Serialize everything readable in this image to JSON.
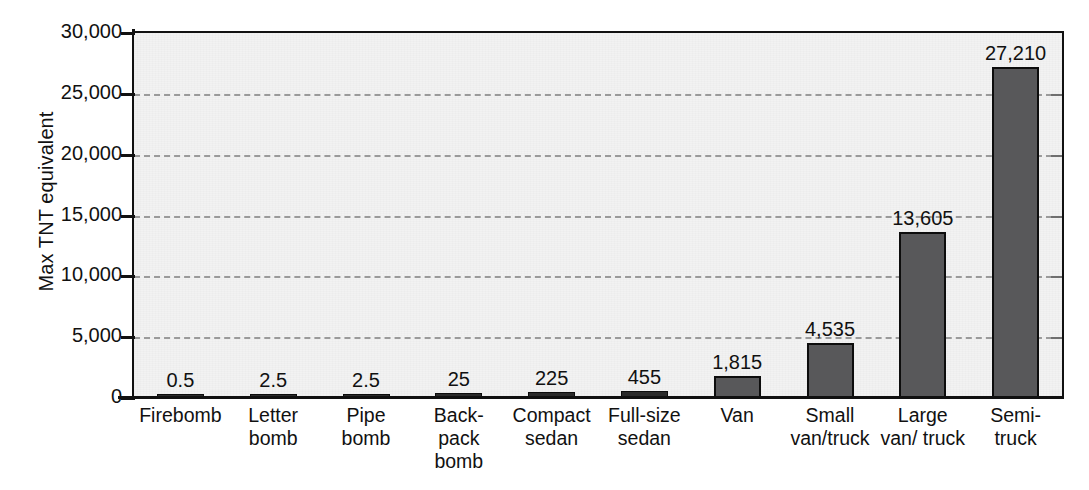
{
  "chart_data": {
    "type": "bar",
    "title": "",
    "subtitle": "",
    "xlabel": "",
    "ylabel": "Max TNT equivalent",
    "ylim": [
      0,
      30000
    ],
    "grid": true,
    "legend": null,
    "categories": [
      "Firebomb",
      "Letter bomb",
      "Pipe bomb",
      "Back-pack bomb",
      "Compact sedan",
      "Full-size sedan",
      "Van",
      "Small van/truck",
      "Large van/ truck",
      "Semi-truck"
    ],
    "category_lines": [
      [
        "Firebomb"
      ],
      [
        "Letter",
        "bomb"
      ],
      [
        "Pipe",
        "bomb"
      ],
      [
        "Back-",
        "pack",
        "bomb"
      ],
      [
        "Compact",
        "sedan"
      ],
      [
        "Full-size",
        "sedan"
      ],
      [
        "Van"
      ],
      [
        "Small",
        "van/truck"
      ],
      [
        "Large",
        "van/ truck"
      ],
      [
        "Semi-",
        "truck"
      ]
    ],
    "values": [
      0.5,
      2.5,
      2.5,
      25,
      225,
      455,
      1815,
      4535,
      13605,
      27210
    ],
    "value_labels": [
      "0.5",
      "2.5",
      "2.5",
      "25",
      "225",
      "455",
      "1,815",
      "4,535",
      "13,605",
      "27,210"
    ],
    "y_ticks": [
      0,
      5000,
      10000,
      15000,
      20000,
      25000,
      30000
    ],
    "y_tick_labels": [
      "0",
      "5,000",
      "10,000",
      "15,000",
      "20,000",
      "25,000",
      "30,000"
    ],
    "colors": {
      "bar_fill": "#58585a",
      "bar_border": "#0d0d0d",
      "plot_background": "#f2f2f2",
      "gridline": "#9a9a9a",
      "axis": "#111111",
      "text": "#111111"
    }
  }
}
